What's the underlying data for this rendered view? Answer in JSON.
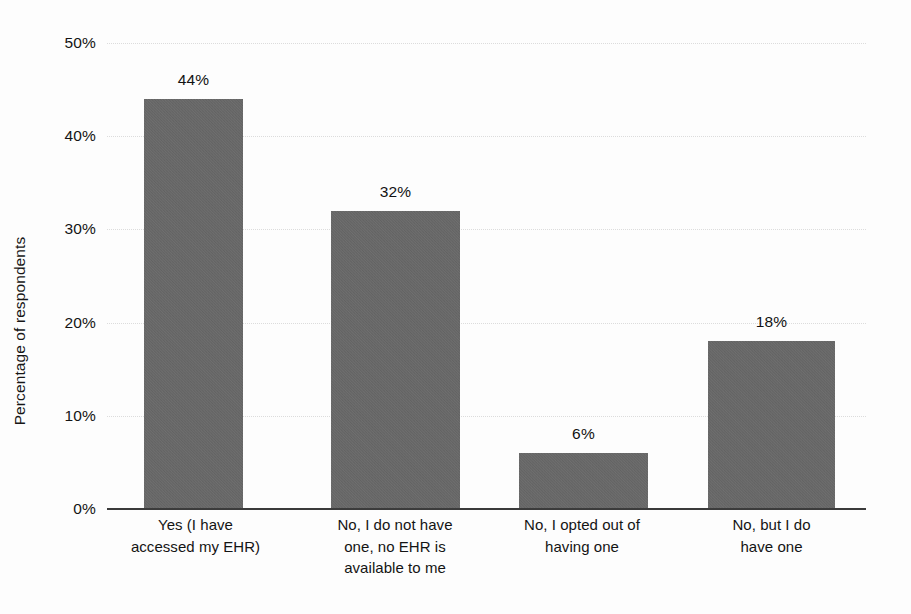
{
  "chart_data": {
    "type": "bar",
    "title": "",
    "subtitle": "",
    "xlabel": "",
    "ylabel": "Percentage of respondents",
    "categories": [
      "Yes (I have accessed my EHR)",
      "No, I do not have one, no EHR is available to me",
      "No, I opted out of having one",
      "No, but I do have one"
    ],
    "category_lines": [
      [
        "Yes (I have",
        "accessed my EHR)"
      ],
      [
        "No, I do not have",
        "one, no EHR is",
        "available to me"
      ],
      [
        "No, I opted out of",
        "having one"
      ],
      [
        "No, but I do",
        "have one"
      ]
    ],
    "values": [
      44,
      32,
      6,
      18
    ],
    "value_labels": [
      "44%",
      "32%",
      "6%",
      "18%"
    ],
    "ylim": [
      0,
      50
    ],
    "ytick_values": [
      0,
      10,
      20,
      30,
      40,
      50
    ],
    "ytick_labels": [
      "0%",
      "10%",
      "20%",
      "30%",
      "40%",
      "50%"
    ],
    "grid": true,
    "grid_axis": "y",
    "legend": false,
    "legend_position": "none",
    "bar_color": "#666666",
    "axis_color": "#3b3b3b",
    "grid_color": "#dcdcdc",
    "text_color": "#141414",
    "background_color": "#fdfdfd"
  }
}
